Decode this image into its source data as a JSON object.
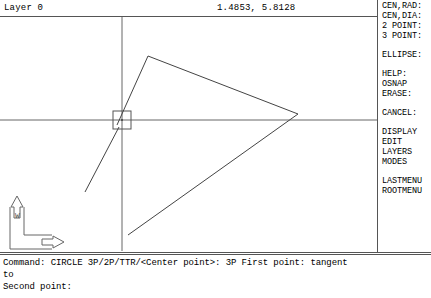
{
  "status_bar": {
    "layer_label": "Layer 0",
    "coordinates": "1.4853, 5.8128"
  },
  "screen_menu": {
    "items": [
      {
        "label": "CEN,RAD:",
        "gap_after": false
      },
      {
        "label": "CEN,DIA:",
        "gap_after": false
      },
      {
        "label": "2 POINT:",
        "gap_after": false
      },
      {
        "label": "3 POINT:",
        "gap_after": true
      },
      {
        "label": "ELLIPSE:",
        "gap_after": true
      },
      {
        "label": "HELP:",
        "gap_after": false
      },
      {
        "label": "OSNAP",
        "gap_after": false
      },
      {
        "label": "ERASE:",
        "gap_after": true
      },
      {
        "label": "CANCEL:",
        "gap_after": true
      },
      {
        "label": "DISPLAY",
        "gap_after": false
      },
      {
        "label": "EDIT",
        "gap_after": false
      },
      {
        "label": "LAYERS",
        "gap_after": false
      },
      {
        "label": "MODES",
        "gap_after": true
      },
      {
        "label": "LASTMENU",
        "gap_after": false
      },
      {
        "label": "ROOTMENU",
        "gap_after": false
      }
    ]
  },
  "command_area": {
    "lines": [
      "Command: CIRCLE 3P/2P/TTR/<Center point>: 3P First point: tangent",
      "to",
      "Second point:"
    ]
  },
  "ucs_icon": {
    "origin_label": "W",
    "y_axis_label": "Y",
    "x_axis_label": "X"
  },
  "drawing": {
    "colors": {
      "geometry": "#444444",
      "crosshair": "#666666",
      "pickbox": "#555555",
      "ucs_icon": "#666666",
      "background": "#ffffff"
    },
    "crosshair": {
      "x": 122,
      "y": 103,
      "pickbox_size": 18
    },
    "triangle": {
      "vertices": [
        [
          148,
          39
        ],
        [
          298,
          97
        ],
        [
          128,
          218
        ]
      ]
    },
    "construction_line": {
      "from": [
        85,
        175
      ],
      "to": [
        130,
        112
      ]
    }
  }
}
